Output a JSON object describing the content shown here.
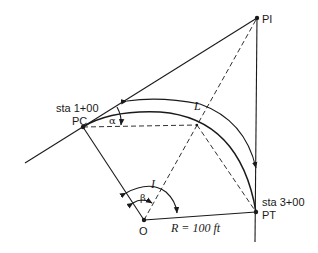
{
  "figure": {
    "type": "horizontal circular curve geometry",
    "colors": {
      "ink": "#1a1a1a",
      "background": "#ffffff"
    },
    "points": {
      "PI": {
        "label": "PI"
      },
      "PC": {
        "label": "PC",
        "station": "sta 1+00"
      },
      "PT": {
        "label": "PT",
        "station": "sta 3+00"
      },
      "O": {
        "label": "O"
      }
    },
    "labels": {
      "arc_length": "L",
      "intersection_angle": "I",
      "deflection_angle": "α",
      "central_angle": "β",
      "radius": "R = 100 ft"
    }
  }
}
